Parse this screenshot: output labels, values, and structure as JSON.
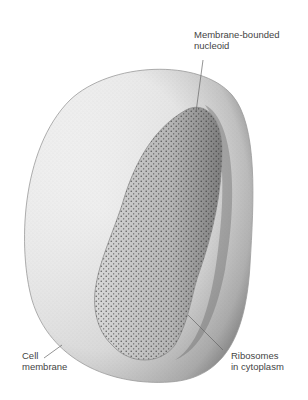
{
  "figure": {
    "labels": {
      "nucleoid": {
        "line1": "Membrane-bounded",
        "line2": "nucleoid"
      },
      "cell_membrane": {
        "line1": "Cell",
        "line2": "membrane"
      },
      "ribosomes": {
        "line1": "Ribosomes",
        "line2": "in cytoplasm"
      }
    },
    "colors": {
      "background": "#ffffff",
      "cell_fill": "#f2f2f2",
      "cell_shadow": "#8a8a8a",
      "nucleoid_fill": "#bdbdbd",
      "stipple": "#3a3a3a",
      "leader_line": "#666666",
      "text": "#444444"
    }
  }
}
